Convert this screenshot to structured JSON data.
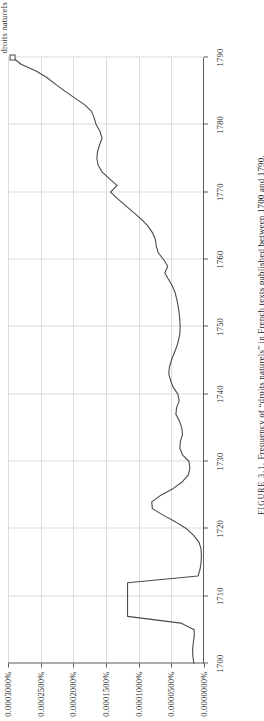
{
  "figure": {
    "caption_prefix": "FIGURE 3.1.",
    "caption_text": "Frequency of “droits naturels” in French texts published between 1700 and 1790.",
    "series_label": "droits naturels",
    "orientation": "rotated-90"
  },
  "colors": {
    "line": "#4a4a4a",
    "axis": "#5a5a5a",
    "grid": "#dcdcdc",
    "background": "#ffffff",
    "text": "#1a1a1a"
  },
  "axes": {
    "x_ticks": [
      "1700",
      "1710",
      "1720",
      "1730",
      "1740",
      "1750",
      "1760",
      "1770",
      "1780",
      "1790"
    ],
    "y_ticks": [
      "0.0000000%",
      "0.0000500%",
      "0.0001000%",
      "0.0001500%",
      "0.0002000%",
      "0.0002500%",
      "0.0003000%"
    ]
  },
  "chart_data": {
    "type": "line",
    "title": "Frequency of “droits naturels” in French texts published between 1700 and 1790.",
    "xlabel": "",
    "ylabel": "",
    "series_name": "droits naturels",
    "xlim": [
      1700,
      1790
    ],
    "ylim": [
      0.0,
      3e-07
    ],
    "y_tick_values": [
      0.0,
      5e-08,
      1e-07,
      1.5e-07,
      2e-07,
      2.5e-07,
      3e-07
    ],
    "y_tick_labels": [
      "0.0000000%",
      "0.0000500%",
      "0.0001000%",
      "0.0001500%",
      "0.0002000%",
      "0.0002500%",
      "0.0003000%"
    ],
    "x_tick_values": [
      1700,
      1710,
      1720,
      1730,
      1740,
      1750,
      1760,
      1770,
      1780,
      1790
    ],
    "grid": true,
    "legend": "none",
    "units": "percent of all bigrams",
    "x": [
      1700,
      1701,
      1702,
      1703,
      1704,
      1705,
      1706,
      1707,
      1708,
      1709,
      1710,
      1711,
      1712,
      1713,
      1714,
      1715,
      1716,
      1717,
      1718,
      1719,
      1720,
      1721,
      1722,
      1723,
      1724,
      1725,
      1726,
      1727,
      1728,
      1729,
      1730,
      1731,
      1732,
      1733,
      1734,
      1735,
      1736,
      1737,
      1738,
      1739,
      1740,
      1741,
      1742,
      1743,
      1744,
      1745,
      1746,
      1747,
      1748,
      1749,
      1750,
      1751,
      1752,
      1753,
      1754,
      1755,
      1756,
      1757,
      1758,
      1759,
      1760,
      1761,
      1762,
      1763,
      1764,
      1765,
      1766,
      1767,
      1768,
      1769,
      1770,
      1771,
      1772,
      1773,
      1774,
      1775,
      1776,
      1777,
      1778,
      1779,
      1780,
      1781,
      1782,
      1783,
      1784,
      1785,
      1786,
      1787,
      1788,
      1789,
      1790
    ],
    "y": [
      1.55e-08,
      1.7e-08,
      1.75e-08,
      1.65e-08,
      1.5e-08,
      1.5e-08,
      3.55e-08,
      1.17e-07,
      1.17e-07,
      1.17e-07,
      1.17e-07,
      1.17e-07,
      1.17e-07,
      9e-09,
      6e-09,
      4.5e-09,
      4e-09,
      4.5e-09,
      7.5e-09,
      1.55e-08,
      2.65e-08,
      4.3e-08,
      6.2e-08,
      7.9e-08,
      8e-08,
      6.6e-08,
      4.7e-08,
      3.3e-08,
      2.4e-08,
      2.15e-08,
      2.3e-08,
      3.3e-08,
      3.7e-08,
      3.6e-08,
      3.3e-08,
      3.4e-08,
      3.75e-08,
      4.3e-08,
      4.2e-08,
      3.8e-08,
      4e-08,
      4.7e-08,
      5.1e-08,
      5.4e-08,
      5.3e-08,
      5e-08,
      4.6e-08,
      4.2e-08,
      3.9e-08,
      3.7e-08,
      3.65e-08,
      3.7e-08,
      3.8e-08,
      3.95e-08,
      4.15e-08,
      4.4e-08,
      4.8e-08,
      5.4e-08,
      6e-08,
      5.55e-08,
      6.2e-08,
      7e-08,
      7.3e-08,
      7.45e-08,
      7.9e-08,
      8.6e-08,
      9.6e-08,
      1.08e-07,
      1.2e-07,
      1.32e-07,
      1.43e-07,
      1.33e-07,
      1.45e-07,
      1.56e-07,
      1.62e-07,
      1.64e-07,
      1.63e-07,
      1.6e-07,
      1.56e-07,
      1.59e-07,
      1.65e-07,
      1.68e-07,
      1.72e-07,
      1.83e-07,
      1.98e-07,
      2.13e-07,
      2.27e-07,
      2.4e-07,
      2.57e-07,
      2.8e-07,
      2.93e-07
    ]
  }
}
